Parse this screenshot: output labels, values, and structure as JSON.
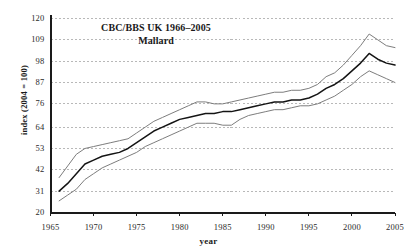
{
  "chart_data": {
    "type": "line",
    "title": "CBC/BBS UK 1966–2005",
    "subtitle": "Mallard",
    "xlabel": "year",
    "ylabel": "index (2004 = 100)",
    "xlim": [
      1965,
      2005
    ],
    "ylim": [
      20,
      120
    ],
    "grid": true,
    "legend": "none",
    "yticks": [
      20,
      31,
      42,
      53,
      64,
      76,
      87,
      98,
      109,
      120
    ],
    "ytick_labels": [
      "20",
      "31",
      "42",
      "53",
      "64",
      "76",
      "87",
      "98",
      "109",
      "120"
    ],
    "xticks": [
      1965,
      1970,
      1975,
      1980,
      1985,
      1990,
      1995,
      2000,
      2005
    ],
    "xtick_labels": [
      "1965",
      "1970",
      "1975",
      "1980",
      "1985",
      "1990",
      "1995",
      "2000",
      "2005"
    ],
    "x": [
      1966,
      1967,
      1968,
      1969,
      1970,
      1971,
      1972,
      1973,
      1974,
      1975,
      1976,
      1977,
      1978,
      1979,
      1980,
      1981,
      1982,
      1983,
      1984,
      1985,
      1986,
      1987,
      1988,
      1989,
      1990,
      1991,
      1992,
      1993,
      1994,
      1995,
      1996,
      1997,
      1998,
      1999,
      2000,
      2001,
      2002,
      2003,
      2004,
      2005
    ],
    "series": [
      {
        "name": "upper confidence limit",
        "color": "#7d7d7d",
        "values": [
          38,
          44,
          50,
          53,
          54,
          55,
          56,
          57,
          58,
          61,
          64,
          67,
          69,
          71,
          73,
          75,
          77,
          77,
          76,
          76,
          77,
          78,
          79,
          80,
          81,
          82,
          82,
          83,
          83,
          84,
          86,
          90,
          92,
          96,
          101,
          106,
          112,
          109,
          106,
          105
        ]
      },
      {
        "name": "smoothed index",
        "color": "#141414",
        "values": [
          31,
          35,
          40,
          45,
          47,
          49,
          50,
          51,
          53,
          56,
          59,
          62,
          64,
          66,
          68,
          69,
          70,
          71,
          71,
          72,
          72,
          73,
          74,
          75,
          76,
          77,
          77,
          78,
          78,
          79,
          81,
          84,
          86,
          89,
          93,
          97,
          102,
          99,
          97,
          96
        ]
      },
      {
        "name": "lower confidence limit",
        "color": "#7d7d7d",
        "values": [
          26,
          29,
          32,
          37,
          40,
          43,
          45,
          47,
          49,
          51,
          54,
          56,
          58,
          60,
          62,
          64,
          66,
          66,
          66,
          65,
          65,
          68,
          70,
          71,
          72,
          73,
          73,
          74,
          75,
          75,
          76,
          78,
          80,
          83,
          86,
          90,
          93,
          91,
          89,
          87
        ]
      }
    ]
  },
  "axes": {
    "axis_color": "#1a1a1a",
    "grid_color": "#9a9a9a"
  }
}
